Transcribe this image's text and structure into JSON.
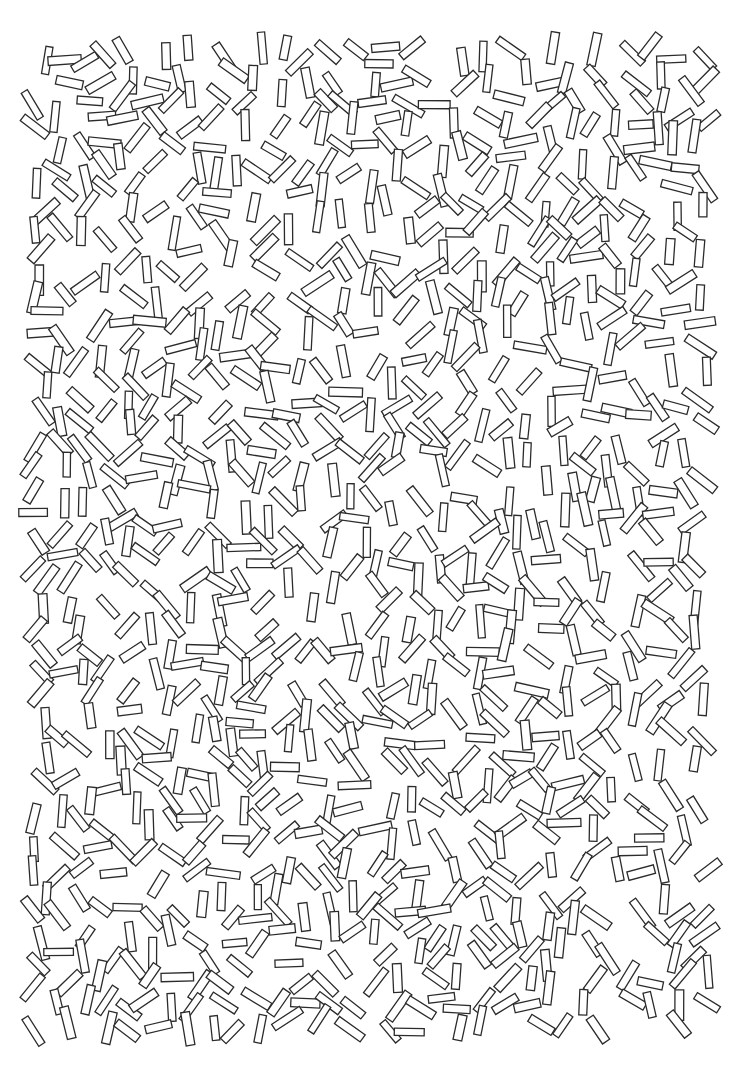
{
  "page": {
    "width": 736,
    "height": 1084,
    "background": "#ffffff"
  },
  "pattern": {
    "description": "Scattered outlined rectangles",
    "shape": "rectangle",
    "fill": "#ffffff",
    "stroke": "#2b2b2b",
    "stroke_width": 1.3,
    "region": {
      "x0": 40,
      "y0": 55,
      "x1": 718,
      "y1": 1030
    },
    "rect_length_min": 24,
    "rect_length_max": 34,
    "rect_width_min": 7,
    "rect_width_max": 9,
    "grid_step_x": 22,
    "grid_step_y": 22,
    "jitter": 9,
    "density": 0.96,
    "seed": 73
  }
}
